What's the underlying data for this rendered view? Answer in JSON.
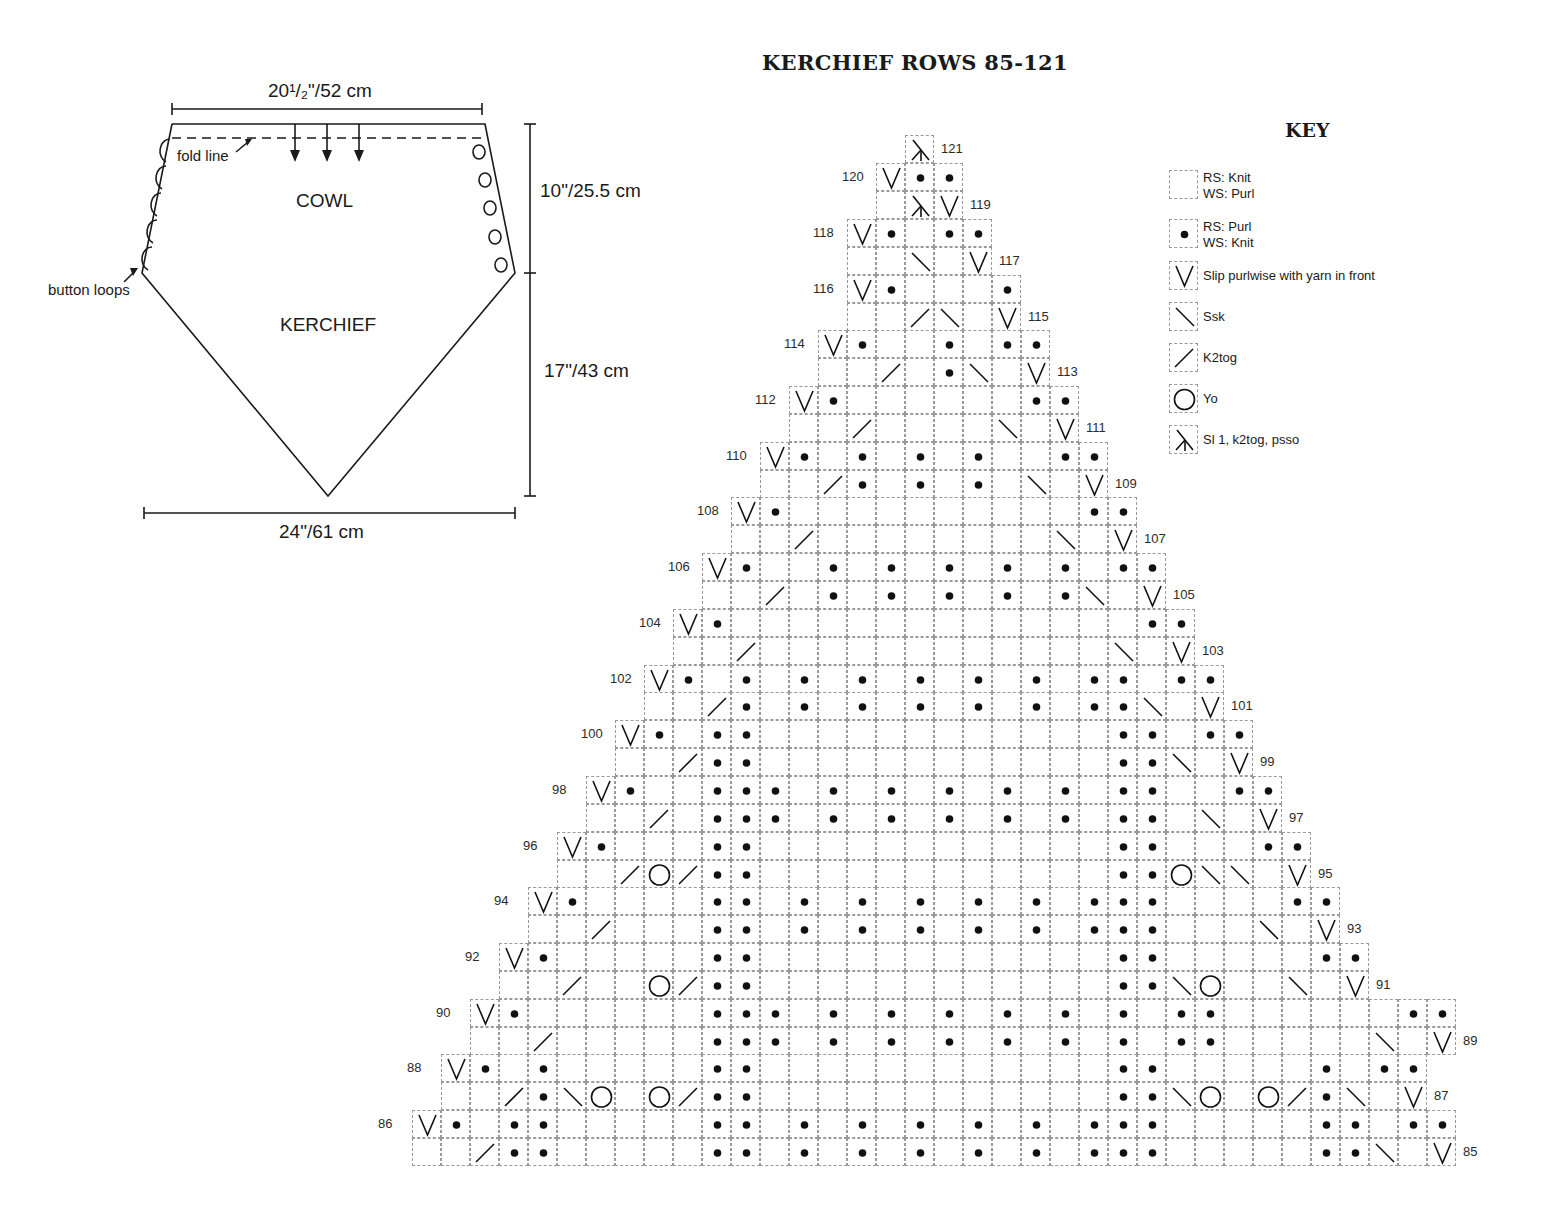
{
  "schematic": {
    "top_width": "20¹/₂\"/52 cm",
    "bottom_width": "24\"/61 cm",
    "cowl_height": "10\"/25.5 cm",
    "kerchief_height": "17\"/43 cm",
    "label_cowl": "COWL",
    "label_kerchief": "KERCHIEF",
    "label_fold_line": "fold line",
    "label_button_loops": "button loops",
    "button_loop_count": 5,
    "button_count": 5,
    "arrow_count": 3
  },
  "chart_title": "KERCHIEF ROWS 85-121",
  "key": {
    "title": "KEY",
    "items": [
      {
        "symbol": "knit",
        "line1": "RS: Knit",
        "line2": "WS: Purl"
      },
      {
        "symbol": "purl",
        "line1": "RS: Purl",
        "line2": "WS: Knit"
      },
      {
        "symbol": "slip",
        "line1": "Slip purlwise with yarn in front",
        "line2": ""
      },
      {
        "symbol": "ssk",
        "line1": "Ssk",
        "line2": ""
      },
      {
        "symbol": "k2tog",
        "line1": "K2tog",
        "line2": ""
      },
      {
        "symbol": "yo",
        "line1": "Yo",
        "line2": ""
      },
      {
        "symbol": "sk2p",
        "line1": "Sl 1, k2tog, psso",
        "line2": ""
      }
    ]
  },
  "chart_data": {
    "type": "table",
    "title": "KERCHIEF ROWS 85-121",
    "legend": {
      ".": "RS: Knit / WS: Purl",
      "p": "RS: Purl / WS: Knit",
      "v": "Slip purlwise with yarn in front",
      "s": "Ssk",
      "k": "K2tog",
      "o": "Yo",
      "x": "Sl 1, k2tog, psso"
    },
    "columns": 36,
    "rows": [
      {
        "row": 121,
        "start": 17,
        "cells": "x"
      },
      {
        "row": 120,
        "start": 16,
        "cells": "vpp"
      },
      {
        "row": 119,
        "start": 16,
        "cells": ".xv"
      },
      {
        "row": 118,
        "start": 15,
        "cells": "vp.pp"
      },
      {
        "row": 117,
        "start": 15,
        "cells": "..s.v"
      },
      {
        "row": 116,
        "start": 15,
        "cells": "vp...p"
      },
      {
        "row": 115,
        "start": 15,
        "cells": "..ks.v"
      },
      {
        "row": 114,
        "start": 14,
        "cells": "vp..p.pp"
      },
      {
        "row": 113,
        "start": 14,
        "cells": "..k.ps.v"
      },
      {
        "row": 112,
        "start": 13,
        "cells": "vp......pp"
      },
      {
        "row": 111,
        "start": 13,
        "cells": "..k....s.v"
      },
      {
        "row": 110,
        "start": 12,
        "cells": "vp.p.p.p..pp"
      },
      {
        "row": 109,
        "start": 12,
        "cells": "..kp.p.p.s.v"
      },
      {
        "row": 108,
        "start": 11,
        "cells": "vp..........pp"
      },
      {
        "row": 107,
        "start": 11,
        "cells": "..k........s.v"
      },
      {
        "row": 106,
        "start": 10,
        "cells": "vp..p.p.p.p.p.pp"
      },
      {
        "row": 105,
        "start": 10,
        "cells": "..k.p.p.p.p.ps.v"
      },
      {
        "row": 104,
        "start": 9,
        "cells": "vp..............pp"
      },
      {
        "row": 103,
        "start": 9,
        "cells": "..k............s.v"
      },
      {
        "row": 102,
        "start": 8,
        "cells": "vp.p.p.p.p.p.p.pp.pp"
      },
      {
        "row": 101,
        "start": 8,
        "cells": "..kp.p.p.p.p.p.pps.v"
      },
      {
        "row": 100,
        "start": 7,
        "cells": "vp.pp............pp.pp"
      },
      {
        "row": 99,
        "start": 7,
        "cells": "..kpp............pps.v"
      },
      {
        "row": 98,
        "start": 6,
        "cells": "vp..ppp.p.p.p.p.p.pp..pp"
      },
      {
        "row": 97,
        "start": 6,
        "cells": "..k.ppp.p.p.p.p.p.pp.s.v"
      },
      {
        "row": 96,
        "start": 5,
        "cells": "vp...pp............pp...pp"
      },
      {
        "row": 95,
        "start": 5,
        "cells": "..kokpp............pposs.v"
      },
      {
        "row": 94,
        "start": 4,
        "cells": "vp....pp.p.p.p.p.p.ppp....pp"
      },
      {
        "row": 93,
        "start": 4,
        "cells": "..k...pp.p.p.p.p.p.ppp...s.v"
      },
      {
        "row": 92,
        "start": 3,
        "cells": "vp.....pp............pp.....pp"
      },
      {
        "row": 91,
        "start": 3,
        "cells": "..k..okpp............ppso..s.v"
      },
      {
        "row": 90,
        "start": 2,
        "cells": "vp......ppp.p.p.p.p.p.p.pp......pp"
      },
      {
        "row": 89,
        "start": 2,
        "cells": "..k.....ppp.p.p.p.p.p.p.pp.....s.v"
      },
      {
        "row": 88,
        "start": 1,
        "cells": "vp.p.....pp............pp.....p.pp"
      },
      {
        "row": 87,
        "start": 1,
        "cells": "..kpso.okpp............ppso.okps.v"
      },
      {
        "row": 86,
        "start": 0,
        "cells": "vp.pp.....pp.p.p.p.p.p.ppp.....pp.pp"
      },
      {
        "row": 85,
        "start": 0,
        "cells": "..kpp.....pp.p.p.p.p.p.ppp.....pps.v"
      }
    ]
  }
}
